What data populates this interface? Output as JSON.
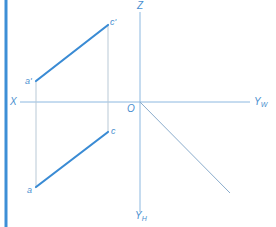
{
  "diagram": {
    "type": "orthographic-projection",
    "colors": {
      "accent_bar": "#3d8fd6",
      "segment": "#3a8bd4",
      "axis": "#8cb8e0",
      "projection_line": "#b9c9d6",
      "label": "#4a8fcf"
    },
    "axes": {
      "x_label": "X",
      "z_label": "Z",
      "yw_label_main": "Y",
      "yw_label_sub": "W",
      "yh_label_main": "Y",
      "yh_label_sub": "H",
      "origin_label": "O"
    },
    "points": {
      "a_prime": "a'",
      "c_prime": "c'",
      "a": "a",
      "c": "c"
    },
    "segments": [
      {
        "name": "front-view-segment",
        "from": "a'",
        "to": "c'"
      },
      {
        "name": "top-view-segment",
        "from": "a",
        "to": "c"
      }
    ]
  }
}
